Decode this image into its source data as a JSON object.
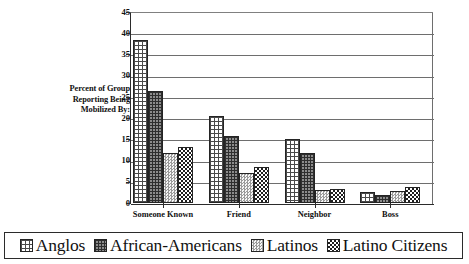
{
  "chart_data": {
    "type": "bar",
    "title": "",
    "xlabel": "",
    "ylabel": "Percent of Group Reporting Being Mobilized By:",
    "ylabel_lines": [
      "Percent of Group",
      "Reporting Being",
      "Mobilized By:"
    ],
    "categories": [
      "Someone Known",
      "Friend",
      "Neighbor",
      "Boss"
    ],
    "series": [
      {
        "name": "Anglos",
        "pattern": "light-grid",
        "values": [
          38.4,
          20.4,
          15.0,
          2.5
        ]
      },
      {
        "name": "African-Americans",
        "pattern": "dark-grid",
        "values": [
          26.4,
          15.8,
          11.9,
          1.9
        ]
      },
      {
        "name": "Latinos",
        "pattern": "light-dots",
        "values": [
          11.8,
          7.0,
          3.0,
          2.8
        ]
      },
      {
        "name": "Latino Citizens",
        "pattern": "checkerboard",
        "values": [
          13.1,
          8.4,
          3.4,
          3.8
        ]
      }
    ],
    "ylim": [
      0,
      45
    ],
    "ytick_values": [
      0,
      5,
      10,
      15,
      20,
      25,
      30,
      35,
      40,
      45
    ],
    "ytick_labels": [
      "0",
      "5",
      "10",
      "15",
      "20",
      "25",
      "30",
      "35",
      "40",
      "45"
    ],
    "grid": "horizontal",
    "legend_position": "bottom",
    "colors": {
      "axis": "#2b2b2b",
      "gridline": "#6e6e6e",
      "bar_outline": "#242424",
      "background": "#ffffff"
    }
  },
  "legend": {
    "items": [
      {
        "label": "Anglos"
      },
      {
        "label": "African-Americans"
      },
      {
        "label": "Latinos"
      },
      {
        "label": "Latino Citizens"
      }
    ]
  }
}
